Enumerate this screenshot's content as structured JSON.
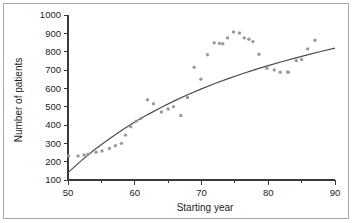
{
  "figure": {
    "border_color": "#a8a8a8",
    "background": "#ffffff"
  },
  "chart_data": {
    "type": "scatter",
    "title": "",
    "xlabel": "Starting year",
    "ylabel": "Number of patients",
    "xlim": [
      50,
      90
    ],
    "ylim": [
      100,
      1000
    ],
    "xticks": [
      50,
      60,
      70,
      80,
      90
    ],
    "xtick_labels": [
      "50",
      "60",
      "70",
      "80",
      "90"
    ],
    "x_minor_ticks": [
      55,
      65,
      75,
      85
    ],
    "yticks": [
      100,
      200,
      300,
      400,
      500,
      600,
      700,
      800,
      900,
      1000
    ],
    "ytick_labels": [
      "100",
      "200",
      "300",
      "400",
      "500",
      "600",
      "700",
      "800",
      "900",
      "1000"
    ],
    "grid": false,
    "legend": null,
    "point_color": "#9a9a9a",
    "line_color": "#4a4a4a",
    "series": [
      {
        "name": "Number of patients",
        "type": "scatter",
        "x": [
          50,
          51,
          52,
          53,
          54,
          55,
          56,
          57,
          58,
          59,
          60,
          61,
          62,
          63,
          64,
          65,
          66,
          67,
          68,
          69,
          70,
          71,
          72,
          73,
          74,
          75,
          76,
          77,
          78,
          79,
          80,
          81,
          82,
          83,
          84,
          85,
          86,
          87
        ],
        "y": [
          232,
          232,
          235,
          240,
          252,
          258,
          272,
          287,
          300,
          345,
          390,
          420,
          435,
          538,
          515,
          470,
          487,
          500,
          452,
          550,
          715,
          650,
          783,
          848,
          845,
          843,
          875,
          907,
          902,
          875,
          868,
          855,
          786,
          710,
          700,
          688,
          690,
          688
        ]
      },
      {
        "name": "Fitted curve",
        "type": "line",
        "x": [
          50,
          52,
          54,
          56,
          58,
          60,
          62,
          64,
          66,
          68,
          70,
          72,
          74,
          76,
          78,
          80,
          82,
          84,
          86,
          88,
          90
        ],
        "y": [
          140,
          206,
          266,
          320,
          370,
          416,
          458,
          497,
          533,
          566,
          597,
          626,
          653,
          678,
          702,
          724,
          745,
          765,
          784,
          802,
          819
        ]
      }
    ],
    "scatter_points": [
      [
        50.1,
        232
      ],
      [
        51.5,
        231
      ],
      [
        52.4,
        236
      ],
      [
        53.0,
        241
      ],
      [
        54.2,
        252
      ],
      [
        55.1,
        258
      ],
      [
        56.2,
        272
      ],
      [
        57.1,
        287
      ],
      [
        58.0,
        300
      ],
      [
        58.6,
        345
      ],
      [
        59.4,
        390
      ],
      [
        60.2,
        421
      ],
      [
        60.9,
        435
      ],
      [
        61.9,
        538
      ],
      [
        62.8,
        516
      ],
      [
        64.0,
        471
      ],
      [
        65.0,
        487
      ],
      [
        65.8,
        500
      ],
      [
        66.9,
        452
      ],
      [
        67.9,
        550
      ],
      [
        68.9,
        715
      ],
      [
        69.9,
        650
      ],
      [
        70.9,
        783
      ],
      [
        71.9,
        848
      ],
      [
        72.7,
        845
      ],
      [
        73.2,
        843
      ],
      [
        73.9,
        875
      ],
      [
        74.8,
        907
      ],
      [
        75.7,
        902
      ],
      [
        76.4,
        875
      ],
      [
        77.1,
        868
      ],
      [
        77.7,
        855
      ],
      [
        78.6,
        786
      ],
      [
        79.8,
        710
      ],
      [
        80.9,
        700
      ],
      [
        81.8,
        688
      ],
      [
        82.9,
        690
      ],
      [
        83.0,
        688
      ],
      [
        84.2,
        751
      ],
      [
        85.0,
        757
      ],
      [
        85.9,
        815
      ],
      [
        87.0,
        862
      ]
    ]
  }
}
